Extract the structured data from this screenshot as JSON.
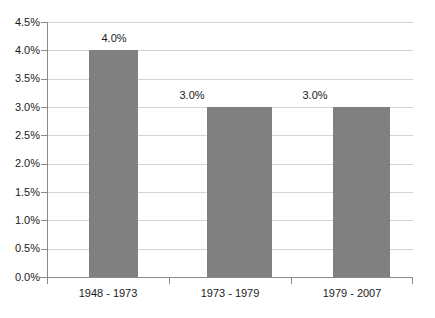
{
  "chart_data": {
    "type": "bar",
    "title": "",
    "subtitle": "",
    "xlabel": "",
    "ylabel": "",
    "categories": [
      "1948 - 1973",
      "1973 - 1979",
      "1979 - 2007"
    ],
    "values": [
      4.0,
      3.0,
      3.0
    ],
    "value_labels": [
      "4.0%",
      "3.0%",
      "3.0%"
    ],
    "ylim": [
      0.0,
      4.5
    ],
    "ytick_values": [
      0.0,
      0.5,
      1.0,
      1.5,
      2.0,
      2.5,
      3.0,
      3.5,
      4.0,
      4.5
    ],
    "ytick_labels": [
      "0.0%",
      "0.5%",
      "1.0%",
      "1.5%",
      "2.0%",
      "2.5%",
      "3.0%",
      "3.5%",
      "4.0%",
      "4.5%"
    ],
    "grid": true,
    "legend": false,
    "legend_position": "none",
    "bar_color": "#808080",
    "gridline_color": "#d4d4d4",
    "axis_color": "#8a8a8a",
    "background_color": "#ffffff",
    "text_color": "#1a1a1a"
  }
}
